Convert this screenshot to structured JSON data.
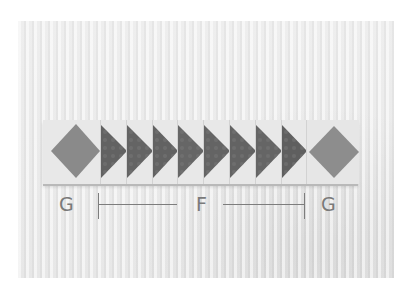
{
  "image": {
    "description": "Photo of a quilt strip: diamond-in-square block at each end with a row of eight flying-geese units pointing right between them, on a light textured fabric background",
    "colors": {
      "background": "#e9e9e9",
      "strip_background": "#e6e6e6",
      "geese_fill": "#666666",
      "diamond_fill": "#8a8a8a",
      "label_color": "#7a7a7a"
    }
  },
  "strip": {
    "left_block": {
      "type": "diamond-in-square",
      "label": "G"
    },
    "geese": {
      "count": 8,
      "direction": "right",
      "label": "F"
    },
    "right_block": {
      "type": "diamond-in-square",
      "label": "G"
    }
  },
  "labels": {
    "left": "G",
    "middle": "F",
    "right": "G"
  }
}
